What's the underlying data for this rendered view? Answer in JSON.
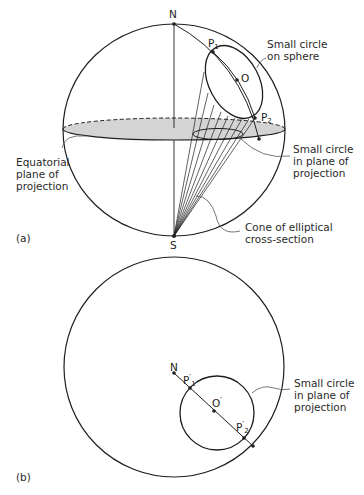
{
  "figure": {
    "panel_a": {
      "label": "(a)",
      "points": {
        "north": "N",
        "south": "S",
        "center": "O",
        "p1": "P",
        "p1_sub": "1",
        "p2": "P",
        "p2_sub": "2"
      },
      "annotations": {
        "small_circle_sphere": [
          "Small circle",
          "on sphere"
        ],
        "small_circle_plane": [
          "Small circle",
          "in plane of",
          "projection"
        ],
        "equatorial_plane": [
          "Equatorial",
          "plane of",
          "projection"
        ],
        "cone": [
          "Cone of elliptical",
          "cross-section"
        ]
      }
    },
    "panel_b": {
      "label": "(b)",
      "points": {
        "north": "N",
        "center": "O",
        "center_prime": "′",
        "p1": "P",
        "p1_sub": "1",
        "p1_prime": "′",
        "p2": "P",
        "p2_sub": "2",
        "p2_prime": "′"
      },
      "annotations": {
        "small_circle_plane": [
          "Small circle",
          "in plane of",
          "projection"
        ]
      }
    }
  },
  "colors": {
    "line": "#1e1e1e",
    "plane_fill": "#d4d4d4",
    "leader": "#555555",
    "text": "#2a2a2a"
  }
}
